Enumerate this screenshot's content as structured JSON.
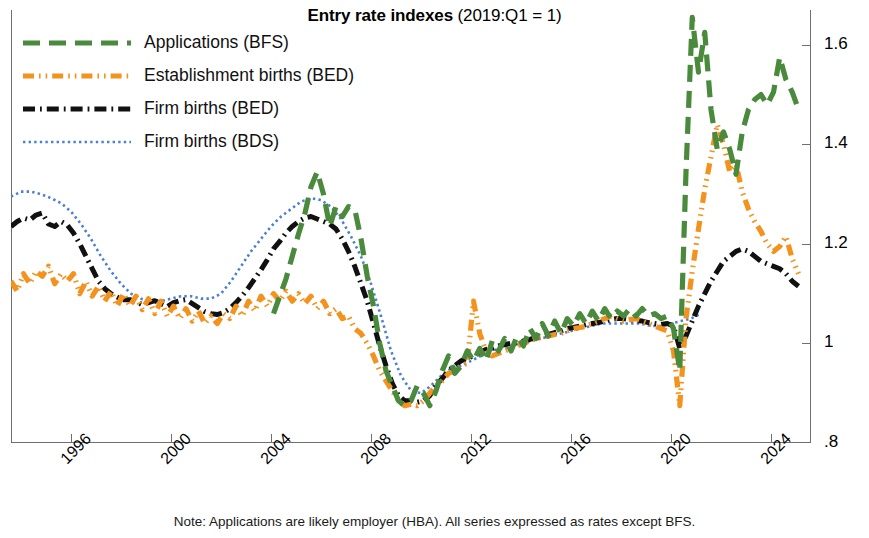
{
  "title": {
    "main": "Entry rate indexes",
    "sub": "(2019:Q1 = 1)"
  },
  "note": "Note: Applications are likely employer (HBA). All series expressed as rates except BFS.",
  "legend": {
    "position": "top-left",
    "items": [
      {
        "label": "Applications (BFS)",
        "key": "applications-bfs",
        "color": "#4a8a3c",
        "style": "long-dash"
      },
      {
        "label": "Establishment births (BED)",
        "key": "establishment-births-bed",
        "color": "#f4921e",
        "style": "dash-dot-dot"
      },
      {
        "label": "Firm births (BED)",
        "key": "firm-births-bed",
        "color": "#111111",
        "style": "dash-dot"
      },
      {
        "label": "Firm births (BDS)",
        "key": "firm-births-bds",
        "color": "#4a7fd4",
        "style": "fine-dot"
      }
    ]
  },
  "axes": {
    "y": {
      "ticks": [
        ".8",
        "1",
        "1.2",
        "1.4",
        "1.6"
      ],
      "tick_values": [
        0.8,
        1.0,
        1.2,
        1.4,
        1.6
      ],
      "min": 0.8,
      "max": 1.67,
      "side": "right"
    },
    "x": {
      "ticks": [
        "1996",
        "2000",
        "2004",
        "2008",
        "2012",
        "2016",
        "2020",
        "2024"
      ],
      "tick_values": [
        1996,
        2000,
        2004,
        2008,
        2012,
        2016,
        2020,
        2024
      ],
      "min": 1993.6,
      "max": 2025.6,
      "rotated": true
    }
  },
  "chart_data": {
    "type": "line",
    "title": "Entry rate indexes (2019:Q1 = 1)",
    "xlabel": "",
    "ylabel": "",
    "xlim": [
      1993.6,
      2025.6
    ],
    "ylim": [
      0.8,
      1.67
    ],
    "grid": false,
    "legend_position": "top-left",
    "annotations": [
      "Note: Applications are likely employer (HBA). All series expressed as rates except BFS."
    ],
    "series": [
      {
        "name": "Firm births (BDS)",
        "color": "#4a7fd4",
        "style": "fine-dot",
        "x": [
          1993.6,
          1994.0,
          1994.4,
          1994.8,
          1995.2,
          1995.6,
          1996.0,
          1996.4,
          1996.8,
          1997.2,
          1997.6,
          1998.0,
          1998.4,
          1998.8,
          1999.2,
          1999.6,
          2000.0,
          2000.4,
          2000.8,
          2001.2,
          2001.6,
          2002.0,
          2002.4,
          2002.8,
          2003.2,
          2003.6,
          2004.0,
          2004.4,
          2004.8,
          2005.2,
          2005.6,
          2006.0,
          2006.4,
          2006.8,
          2007.2,
          2007.6,
          2008.0,
          2008.4,
          2008.8,
          2009.2,
          2009.6,
          2010.0,
          2010.4,
          2010.8,
          2011.2,
          2011.6,
          2012.0,
          2012.4,
          2012.8,
          2013.2,
          2013.6,
          2014.0,
          2014.4,
          2014.8,
          2015.2,
          2015.6,
          2016.0,
          2016.4,
          2016.8,
          2017.2,
          2017.6,
          2018.0,
          2018.4,
          2018.8,
          2019.2,
          2019.6,
          2020.0,
          2020.4,
          2020.8,
          2021.2
        ],
        "y": [
          1.295,
          1.305,
          1.305,
          1.3,
          1.292,
          1.282,
          1.265,
          1.24,
          1.21,
          1.175,
          1.145,
          1.12,
          1.1,
          1.09,
          1.085,
          1.085,
          1.09,
          1.095,
          1.095,
          1.09,
          1.09,
          1.1,
          1.125,
          1.155,
          1.185,
          1.21,
          1.235,
          1.255,
          1.27,
          1.285,
          1.292,
          1.288,
          1.275,
          1.25,
          1.215,
          1.175,
          1.12,
          1.055,
          0.985,
          0.935,
          0.905,
          0.9,
          0.915,
          0.935,
          0.95,
          0.955,
          0.965,
          0.975,
          0.985,
          0.99,
          0.995,
          1.0,
          1.005,
          1.01,
          1.015,
          1.02,
          1.025,
          1.03,
          1.035,
          1.04,
          1.04,
          1.04,
          1.04,
          1.04,
          1.035,
          1.035,
          1.04,
          1.045,
          1.05,
          1.06
        ]
      },
      {
        "name": "Firm births (BED)",
        "color": "#111111",
        "style": "dash-dot",
        "x": [
          1993.6,
          1993.85,
          1994.1,
          1994.35,
          1994.6,
          1994.85,
          1995.1,
          1995.35,
          1995.6,
          1995.85,
          1996.1,
          1996.35,
          1996.6,
          1996.85,
          1997.1,
          1997.35,
          1997.6,
          1997.85,
          1998.1,
          1998.35,
          1998.6,
          1998.85,
          1999.1,
          1999.35,
          1999.6,
          1999.85,
          2000.1,
          2000.35,
          2000.6,
          2000.85,
          2001.1,
          2001.35,
          2001.6,
          2001.85,
          2002.1,
          2002.35,
          2002.6,
          2002.85,
          2003.1,
          2003.35,
          2003.6,
          2003.85,
          2004.1,
          2004.35,
          2004.6,
          2004.85,
          2005.1,
          2005.35,
          2005.6,
          2005.85,
          2006.1,
          2006.35,
          2006.6,
          2006.85,
          2007.1,
          2007.35,
          2007.6,
          2007.85,
          2008.1,
          2008.35,
          2008.6,
          2008.85,
          2009.1,
          2009.35,
          2009.6,
          2009.85,
          2010.1,
          2010.35,
          2010.6,
          2010.85,
          2011.1,
          2011.35,
          2011.6,
          2011.85,
          2012.1,
          2012.35,
          2012.6,
          2012.85,
          2013.1,
          2013.35,
          2013.6,
          2013.85,
          2014.1,
          2014.35,
          2014.6,
          2014.85,
          2015.1,
          2015.35,
          2015.6,
          2015.85,
          2016.1,
          2016.35,
          2016.6,
          2016.85,
          2017.1,
          2017.35,
          2017.6,
          2017.85,
          2018.1,
          2018.35,
          2018.6,
          2018.85,
          2019.1,
          2019.35,
          2019.6,
          2019.85,
          2020.1,
          2020.35,
          2020.6,
          2020.85,
          2021.1,
          2021.35,
          2021.6,
          2021.85,
          2022.1,
          2022.35,
          2022.6,
          2022.85,
          2023.1,
          2023.35,
          2023.6,
          2023.85,
          2024.1,
          2024.35,
          2024.6,
          2024.85,
          2025.1
        ],
        "y": [
          1.235,
          1.245,
          1.252,
          1.248,
          1.258,
          1.262,
          1.24,
          1.235,
          1.245,
          1.238,
          1.222,
          1.2,
          1.175,
          1.15,
          1.125,
          1.11,
          1.1,
          1.093,
          1.088,
          1.088,
          1.084,
          1.078,
          1.082,
          1.086,
          1.08,
          1.074,
          1.082,
          1.086,
          1.088,
          1.08,
          1.072,
          1.064,
          1.06,
          1.058,
          1.062,
          1.07,
          1.082,
          1.096,
          1.112,
          1.13,
          1.148,
          1.168,
          1.19,
          1.205,
          1.222,
          1.235,
          1.245,
          1.252,
          1.255,
          1.25,
          1.245,
          1.24,
          1.23,
          1.21,
          1.185,
          1.155,
          1.12,
          1.085,
          1.04,
          0.995,
          0.955,
          0.92,
          0.895,
          0.885,
          0.885,
          0.882,
          0.885,
          0.895,
          0.915,
          0.93,
          0.945,
          0.955,
          0.965,
          0.97,
          0.975,
          0.982,
          0.988,
          0.99,
          0.995,
          0.998,
          1.0,
          1.002,
          1.005,
          1.008,
          1.012,
          1.015,
          1.018,
          1.022,
          1.025,
          1.03,
          1.032,
          1.035,
          1.038,
          1.04,
          1.042,
          1.045,
          1.048,
          1.05,
          1.05,
          1.048,
          1.046,
          1.045,
          1.042,
          1.04,
          1.038,
          1.04,
          1.035,
          0.99,
          1.015,
          1.045,
          1.075,
          1.1,
          1.125,
          1.145,
          1.165,
          1.175,
          1.185,
          1.19,
          1.185,
          1.175,
          1.165,
          1.16,
          1.155,
          1.15,
          1.14,
          1.125,
          1.115
        ]
      },
      {
        "name": "Establishment births (BED)",
        "color": "#f4921e",
        "style": "dash-dot-dot",
        "x": [
          1993.6,
          1993.85,
          1994.1,
          1994.35,
          1994.6,
          1994.85,
          1995.1,
          1995.35,
          1995.6,
          1995.85,
          1996.1,
          1996.35,
          1996.6,
          1996.85,
          1997.1,
          1997.35,
          1997.6,
          1997.85,
          1998.1,
          1998.35,
          1998.6,
          1998.85,
          1999.1,
          1999.35,
          1999.6,
          1999.85,
          2000.1,
          2000.35,
          2000.6,
          2000.85,
          2001.1,
          2001.35,
          2001.6,
          2001.85,
          2002.1,
          2002.35,
          2002.6,
          2002.85,
          2003.1,
          2003.35,
          2003.6,
          2003.85,
          2004.1,
          2004.35,
          2004.6,
          2004.85,
          2005.1,
          2005.35,
          2005.6,
          2005.85,
          2006.1,
          2006.35,
          2006.6,
          2006.85,
          2007.1,
          2007.35,
          2007.6,
          2007.85,
          2008.1,
          2008.35,
          2008.6,
          2008.85,
          2009.1,
          2009.35,
          2009.6,
          2009.85,
          2010.1,
          2010.35,
          2010.6,
          2010.85,
          2011.1,
          2011.35,
          2011.6,
          2011.85,
          2012.1,
          2012.35,
          2012.6,
          2012.85,
          2013.1,
          2013.35,
          2013.6,
          2013.85,
          2014.1,
          2014.35,
          2014.6,
          2014.85,
          2015.1,
          2015.35,
          2015.6,
          2015.85,
          2016.1,
          2016.35,
          2016.6,
          2016.85,
          2017.1,
          2017.35,
          2017.6,
          2017.85,
          2018.1,
          2018.35,
          2018.6,
          2018.85,
          2019.1,
          2019.35,
          2019.6,
          2019.85,
          2020.1,
          2020.35,
          2020.6,
          2020.85,
          2021.1,
          2021.35,
          2021.6,
          2021.85,
          2022.1,
          2022.35,
          2022.6,
          2022.85,
          2023.1,
          2023.35,
          2023.6,
          2023.85,
          2024.1,
          2024.35,
          2024.6,
          2024.85,
          2025.1
        ],
        "y": [
          1.125,
          1.105,
          1.14,
          1.12,
          1.145,
          1.135,
          1.155,
          1.12,
          1.14,
          1.125,
          1.14,
          1.1,
          1.125,
          1.095,
          1.115,
          1.085,
          1.105,
          1.075,
          1.1,
          1.075,
          1.095,
          1.068,
          1.09,
          1.06,
          1.085,
          1.055,
          1.075,
          1.05,
          1.07,
          1.045,
          1.065,
          1.04,
          1.055,
          1.04,
          1.06,
          1.05,
          1.075,
          1.055,
          1.085,
          1.065,
          1.095,
          1.075,
          1.1,
          1.085,
          1.105,
          1.085,
          1.1,
          1.08,
          1.095,
          1.07,
          1.085,
          1.06,
          1.07,
          1.05,
          1.055,
          1.03,
          1.02,
          1.0,
          0.975,
          0.945,
          0.925,
          0.905,
          0.885,
          0.875,
          0.878,
          0.875,
          0.885,
          0.9,
          0.915,
          0.925,
          0.94,
          0.945,
          0.955,
          0.96,
          1.085,
          1.02,
          0.985,
          0.975,
          0.98,
          0.985,
          0.99,
          0.995,
          1.0,
          1.005,
          1.01,
          1.012,
          1.015,
          1.018,
          1.02,
          1.025,
          1.03,
          1.032,
          1.035,
          1.04,
          1.045,
          1.05,
          1.055,
          1.05,
          1.045,
          1.048,
          1.05,
          1.045,
          1.04,
          1.035,
          1.03,
          1.025,
          0.985,
          0.875,
          1.05,
          1.145,
          1.23,
          1.31,
          1.375,
          1.44,
          1.4,
          1.345,
          1.36,
          1.305,
          1.27,
          1.245,
          1.225,
          1.2,
          1.185,
          1.195,
          1.215,
          1.17,
          1.14
        ]
      },
      {
        "name": "Applications (BFS)",
        "color": "#4a8a3c",
        "style": "long-dash",
        "x": [
          2004.1,
          2004.35,
          2004.6,
          2004.85,
          2005.1,
          2005.35,
          2005.6,
          2005.85,
          2006.1,
          2006.35,
          2006.6,
          2006.85,
          2007.1,
          2007.35,
          2007.6,
          2007.85,
          2008.1,
          2008.35,
          2008.6,
          2008.85,
          2009.1,
          2009.35,
          2009.6,
          2009.85,
          2010.1,
          2010.35,
          2010.6,
          2010.85,
          2011.1,
          2011.35,
          2011.6,
          2011.85,
          2012.1,
          2012.35,
          2012.6,
          2012.85,
          2013.1,
          2013.35,
          2013.6,
          2013.85,
          2014.1,
          2014.35,
          2014.6,
          2014.85,
          2015.1,
          2015.35,
          2015.6,
          2015.85,
          2016.1,
          2016.35,
          2016.6,
          2016.85,
          2017.1,
          2017.35,
          2017.6,
          2017.85,
          2018.1,
          2018.35,
          2018.6,
          2018.85,
          2019.1,
          2019.35,
          2019.6,
          2019.85,
          2020.1,
          2020.35,
          2020.6,
          2020.85,
          2021.1,
          2021.35,
          2021.6,
          2021.85,
          2022.1,
          2022.35,
          2022.6,
          2022.85,
          2023.1,
          2023.35,
          2023.6,
          2023.85,
          2024.1,
          2024.35,
          2024.6,
          2024.85,
          2025.1
        ],
        "y": [
          1.06,
          1.095,
          1.13,
          1.175,
          1.22,
          1.26,
          1.315,
          1.345,
          1.3,
          1.235,
          1.275,
          1.255,
          1.275,
          1.27,
          1.21,
          1.135,
          1.075,
          1.0,
          0.945,
          0.915,
          0.885,
          0.875,
          0.885,
          0.915,
          0.9,
          0.875,
          0.905,
          0.945,
          0.975,
          0.94,
          0.955,
          0.985,
          0.965,
          0.99,
          0.965,
          1.005,
          0.985,
          1.01,
          0.985,
          1.015,
          0.995,
          1.03,
          1.01,
          1.04,
          1.015,
          1.045,
          1.02,
          1.05,
          1.035,
          1.06,
          1.04,
          1.065,
          1.045,
          1.07,
          1.05,
          1.065,
          1.055,
          1.07,
          1.055,
          1.07,
          1.055,
          1.06,
          1.05,
          1.055,
          1.03,
          0.945,
          1.345,
          1.655,
          1.545,
          1.625,
          1.47,
          1.39,
          1.425,
          1.39,
          1.34,
          1.425,
          1.47,
          1.49,
          1.5,
          1.48,
          1.505,
          1.575,
          1.53,
          1.505,
          1.47
        ]
      }
    ]
  }
}
